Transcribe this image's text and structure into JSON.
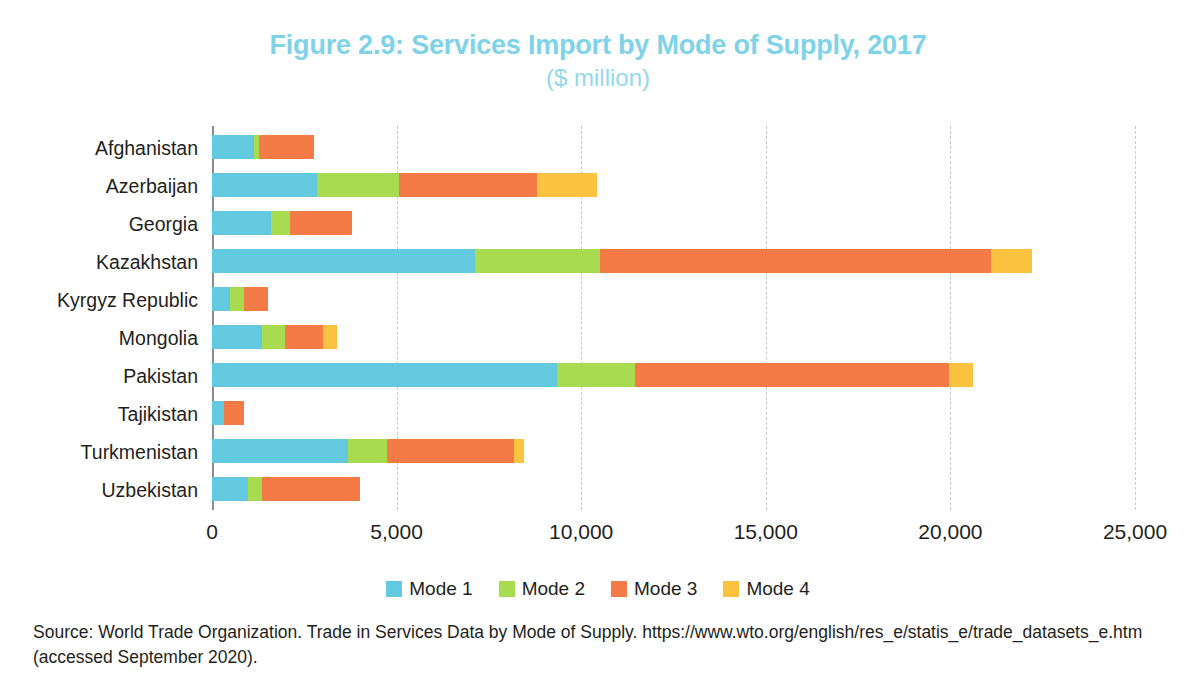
{
  "figure": {
    "title": "Figure 2.9: Services Import by Mode of Supply, 2017",
    "subtitle": "($ million)",
    "title_color": "#7fd3e8",
    "source": "Source: World Trade Organization. Trade in Services Data by Mode of Supply. https://www.wto.org/english/res_e/statis_e/trade_datasets_e.htm (accessed September 2020)."
  },
  "chart_data": {
    "type": "bar",
    "orientation": "horizontal",
    "stacked": true,
    "title": "Figure 2.9: Services Import by Mode of Supply, 2017",
    "subtitle": "($ million)",
    "xlabel": "",
    "ylabel": "",
    "xlim": [
      0,
      25000
    ],
    "xticks": [
      0,
      5000,
      10000,
      15000,
      20000,
      25000
    ],
    "xtick_labels": [
      "0",
      "5,000",
      "10,000",
      "15,000",
      "20,000",
      "25,000"
    ],
    "grid": "vertical-dashed",
    "legend_position": "bottom-center",
    "categories": [
      "Afghanistan",
      "Azerbaijan",
      "Georgia",
      "Kazakhstan",
      "Kyrgyz Republic",
      "Mongolia",
      "Pakistan",
      "Tajikistan",
      "Turkmenistan",
      "Uzbekistan"
    ],
    "series": [
      {
        "name": "Mode 1",
        "color": "#63c9df",
        "values": [
          1140,
          2845,
          1600,
          7125,
          490,
          1355,
          9345,
          325,
          3685,
          975
        ]
      },
      {
        "name": "Mode 2",
        "color": "#a8db4f",
        "values": [
          135,
          2220,
          515,
          3385,
          380,
          625,
          2115,
          0,
          1055,
          380
        ]
      },
      {
        "name": "Mode 3",
        "color": "#f47b46",
        "values": [
          1490,
          3740,
          1680,
          10590,
          650,
          1030,
          8505,
          540,
          3440,
          2655
        ]
      },
      {
        "name": "Mode 4",
        "color": "#fcc340",
        "values": [
          0,
          1625,
          0,
          1110,
          0,
          380,
          650,
          0,
          270,
          0
        ]
      }
    ],
    "totals": [
      2765,
      10430,
      3795,
      22210,
      1520,
      3390,
      20615,
      865,
      8450,
      4010
    ]
  },
  "legend": {
    "items": [
      {
        "label": "Mode 1",
        "color": "#63c9df"
      },
      {
        "label": "Mode 2",
        "color": "#a8db4f"
      },
      {
        "label": "Mode 3",
        "color": "#f47b46"
      },
      {
        "label": "Mode 4",
        "color": "#fcc340"
      }
    ]
  }
}
